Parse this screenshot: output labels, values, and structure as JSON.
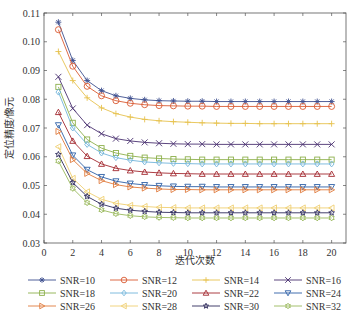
{
  "chart_data": {
    "type": "line",
    "title": "",
    "xlabel": "迭代次数",
    "ylabel": "定位精度/像元",
    "xlim": [
      0,
      21
    ],
    "ylim": [
      0.03,
      0.11
    ],
    "xticks": [
      0,
      2,
      4,
      6,
      8,
      10,
      12,
      14,
      16,
      18,
      20
    ],
    "xtick_labels": [
      "0",
      "2",
      "4",
      "6",
      "8",
      "10",
      "12",
      "14",
      "16",
      "18",
      "20"
    ],
    "yticks": [
      0.03,
      0.04,
      0.05,
      0.06,
      0.07,
      0.08,
      0.09,
      0.1,
      0.11
    ],
    "ytick_labels": [
      "0.03",
      "0.04",
      "0.05",
      "0.06",
      "0.07",
      "0.08",
      "0.09",
      "0.10",
      "0.11"
    ],
    "grid": false,
    "legend_position": "below",
    "x": [
      1,
      2,
      3,
      4,
      5,
      6,
      7,
      8,
      9,
      10,
      11,
      12,
      13,
      14,
      15,
      16,
      17,
      18,
      19,
      20
    ],
    "series": [
      {
        "name": "SNR=10",
        "color": "#3d4f8f",
        "marker": "asterisk",
        "values": [
          0.1068,
          0.0935,
          0.0865,
          0.083,
          0.0812,
          0.0803,
          0.0798,
          0.0795,
          0.0794,
          0.0793,
          0.0793,
          0.0792,
          0.0792,
          0.0792,
          0.0792,
          0.0792,
          0.0792,
          0.0792,
          0.0792,
          0.0792
        ]
      },
      {
        "name": "SNR=12",
        "color": "#d95a32",
        "marker": "circle",
        "values": [
          0.1042,
          0.0915,
          0.0845,
          0.0812,
          0.0795,
          0.0786,
          0.0781,
          0.0778,
          0.0777,
          0.0776,
          0.0776,
          0.0775,
          0.0775,
          0.0775,
          0.0775,
          0.0775,
          0.0775,
          0.0775,
          0.0775,
          0.0775
        ]
      },
      {
        "name": "SNR=14",
        "color": "#e6c24e",
        "marker": "plus",
        "values": [
          0.0966,
          0.0865,
          0.0805,
          0.077,
          0.075,
          0.0738,
          0.073,
          0.0725,
          0.0722,
          0.072,
          0.0718,
          0.0717,
          0.0716,
          0.0716,
          0.0715,
          0.0715,
          0.0715,
          0.0715,
          0.0715,
          0.0715
        ]
      },
      {
        "name": "SNR=16",
        "color": "#4a3170",
        "marker": "x",
        "values": [
          0.0878,
          0.0768,
          0.071,
          0.068,
          0.0663,
          0.0655,
          0.065,
          0.0647,
          0.0645,
          0.0644,
          0.0644,
          0.0643,
          0.0643,
          0.0643,
          0.0643,
          0.0643,
          0.0643,
          0.0643,
          0.0643,
          0.0643
        ]
      },
      {
        "name": "SNR=18",
        "color": "#8db04c",
        "marker": "square",
        "values": [
          0.0843,
          0.0718,
          0.066,
          0.063,
          0.0613,
          0.0603,
          0.0597,
          0.0594,
          0.0592,
          0.0591,
          0.059,
          0.059,
          0.059,
          0.059,
          0.059,
          0.059,
          0.059,
          0.059,
          0.059,
          0.059
        ]
      },
      {
        "name": "SNR=20",
        "color": "#72b4da",
        "marker": "diamond",
        "values": [
          0.0825,
          0.07,
          0.0643,
          0.0613,
          0.0597,
          0.0588,
          0.0582,
          0.0579,
          0.0577,
          0.0576,
          0.0575,
          0.0575,
          0.0575,
          0.0575,
          0.0575,
          0.0575,
          0.0575,
          0.0575,
          0.0575,
          0.0575
        ]
      },
      {
        "name": "SNR=22",
        "color": "#a3282f",
        "marker": "triangle-up",
        "values": [
          0.0755,
          0.0655,
          0.0602,
          0.0575,
          0.056,
          0.0552,
          0.0547,
          0.0544,
          0.0542,
          0.0541,
          0.054,
          0.054,
          0.054,
          0.054,
          0.054,
          0.054,
          0.054,
          0.054,
          0.054,
          0.054
        ]
      },
      {
        "name": "SNR=24",
        "color": "#2d5fa6",
        "marker": "triangle-down",
        "values": [
          0.071,
          0.0605,
          0.0555,
          0.053,
          0.0515,
          0.0507,
          0.0502,
          0.0499,
          0.0497,
          0.0496,
          0.0496,
          0.0495,
          0.0495,
          0.0495,
          0.0495,
          0.0495,
          0.0495,
          0.0495,
          0.0495,
          0.0495
        ]
      },
      {
        "name": "SNR=26",
        "color": "#e07b3c",
        "marker": "triangle-right",
        "values": [
          0.0688,
          0.059,
          0.0542,
          0.0517,
          0.0503,
          0.0495,
          0.0491,
          0.0488,
          0.0486,
          0.0486,
          0.0485,
          0.0485,
          0.0485,
          0.0485,
          0.0485,
          0.0485,
          0.0485,
          0.0485,
          0.0485,
          0.0485
        ]
      },
      {
        "name": "SNR=28",
        "color": "#efcf72",
        "marker": "triangle-left",
        "values": [
          0.0635,
          0.0525,
          0.0478,
          0.0452,
          0.0438,
          0.0431,
          0.0427,
          0.0424,
          0.0423,
          0.0422,
          0.0422,
          0.0422,
          0.0422,
          0.0422,
          0.0422,
          0.0422,
          0.0422,
          0.0422,
          0.0422,
          0.0422
        ]
      },
      {
        "name": "SNR=30",
        "color": "#2f2b5c",
        "marker": "star",
        "values": [
          0.0608,
          0.051,
          0.0462,
          0.0435,
          0.0421,
          0.0414,
          0.041,
          0.0407,
          0.0406,
          0.0405,
          0.0405,
          0.0405,
          0.0405,
          0.0405,
          0.0405,
          0.0405,
          0.0405,
          0.0405,
          0.0405,
          0.0405
        ]
      },
      {
        "name": "SNR=32",
        "color": "#9ab95c",
        "marker": "hexagram",
        "values": [
          0.0585,
          0.049,
          0.044,
          0.0415,
          0.0402,
          0.0395,
          0.0391,
          0.0389,
          0.0388,
          0.0387,
          0.0387,
          0.0387,
          0.0387,
          0.0387,
          0.0387,
          0.0387,
          0.0387,
          0.0387,
          0.0387,
          0.0387
        ]
      }
    ]
  }
}
